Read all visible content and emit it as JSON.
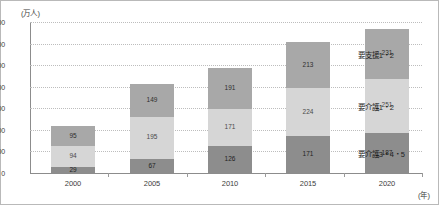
{
  "chart_data": {
    "type": "bar",
    "stacked": true,
    "title": "",
    "xlabel": "(年)",
    "ylabel": "(万人)",
    "ylim": [
      0,
      700
    ],
    "ytick_step": 100,
    "yticks": [
      "0",
      "100",
      "200",
      "300",
      "400",
      "500",
      "600",
      "700"
    ],
    "grid": true,
    "categories": [
      "2000",
      "2005",
      "2010",
      "2015",
      "2020"
    ],
    "series": [
      {
        "name": "要介護3・4・5",
        "color": "#8d8d8d",
        "values": [
          29,
          67,
          126,
          171,
          187
        ]
      },
      {
        "name": "要介護1・2",
        "color": "#d6d6d6",
        "values": [
          94,
          195,
          171,
          224,
          251
        ]
      },
      {
        "name": "要支援1・2",
        "color": "#a8a8a8",
        "values": [
          95,
          149,
          191,
          213,
          231
        ]
      }
    ],
    "totals": [
      218,
      411,
      488,
      608,
      669
    ],
    "legend_position": "right-callouts",
    "annotations": [
      {
        "label": "要支援1・2",
        "target_series": "要支援1・2",
        "target_category": "2020"
      },
      {
        "label": "要介護1・2",
        "target_series": "要介護1・2",
        "target_category": "2020"
      },
      {
        "label": "要介護3・4・5",
        "target_series": "要介護3・4・5",
        "target_category": "2020"
      }
    ]
  },
  "axes": {
    "y_unit": "(万人)",
    "x_unit": "(年)"
  }
}
